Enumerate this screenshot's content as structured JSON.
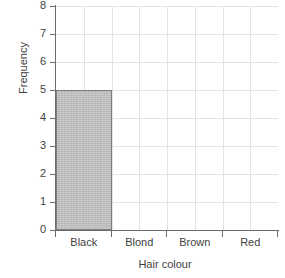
{
  "chart_data": {
    "type": "bar",
    "title": "",
    "xlabel": "Hair colour",
    "ylabel": "Frequency",
    "categories": [
      "Black",
      "Blond",
      "Brown",
      "Red"
    ],
    "values": [
      5,
      0,
      0,
      0
    ],
    "ylim": [
      0,
      8
    ],
    "ytick_labels": [
      "0",
      "1",
      "2",
      "3",
      "4",
      "5",
      "6",
      "7",
      "8"
    ],
    "ytick_values": [
      0,
      1,
      2,
      3,
      4,
      5,
      6,
      7,
      8
    ],
    "grid": true,
    "grid_vertical_count": 8,
    "legend": "none",
    "bar_fill_color": "#bdbdbd",
    "bar_edge_color": "#7d7d7d",
    "grid_color": "#e4e4e4",
    "axis_color": "#6c6c6c",
    "background_color": "#ffffff"
  }
}
